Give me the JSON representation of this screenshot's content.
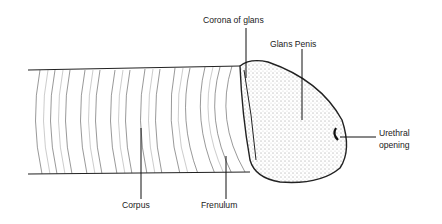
{
  "diagram": {
    "labels": {
      "corona": "Corona of glans",
      "glans": "Glans Penis",
      "urethral_line1": "Urethral",
      "urethral_line2": "opening",
      "corpus": "Corpus",
      "frenulum": "Frenulum"
    },
    "colors": {
      "ink": "#1a1a1a",
      "background": "#ffffff"
    }
  }
}
